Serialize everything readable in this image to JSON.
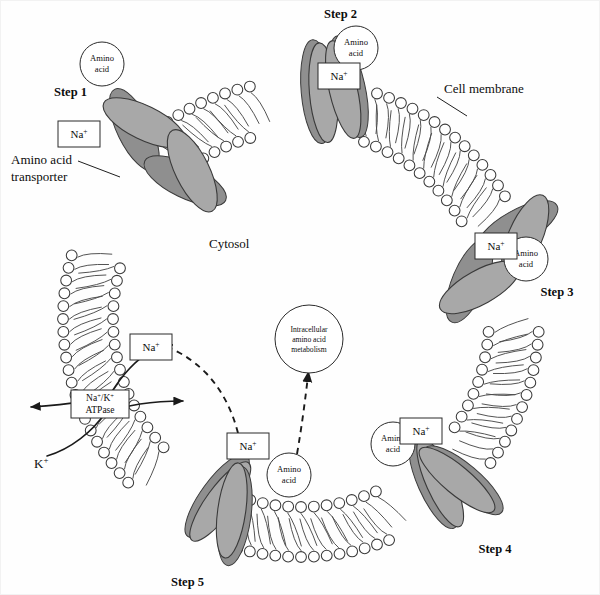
{
  "figure": {
    "background_color": "#fefefe",
    "protein_fill_color": "#a8a8a8",
    "line_color": "#1a1a1a"
  },
  "labels": {
    "cytosol": "Cytosol",
    "cell_membrane": "Cell membrane",
    "amino_acid_transporter_line1": "Amino acid",
    "amino_acid_transporter_line2": "transporter",
    "potassium": "K",
    "potassium_charge": "+",
    "atpase_line1_a": "Na",
    "atpase_line1_a_charge": "+",
    "atpase_line1_slash": "/K",
    "atpase_line1_b_charge": "+",
    "atpase_line2": "ATPase"
  },
  "steps": [
    {
      "id": "step-1",
      "label": "Step 1"
    },
    {
      "id": "step-2",
      "label": "Step 2"
    },
    {
      "id": "step-3",
      "label": "Step 3"
    },
    {
      "id": "step-4",
      "label": "Step 4"
    },
    {
      "id": "step-5",
      "label": "Step 5"
    }
  ],
  "bubbles": {
    "amino_acid_line1": "Amino",
    "amino_acid_line2": "acid",
    "metabolism_line1": "Intracellular",
    "metabolism_line2": "amino acid",
    "metabolism_line3": "metabolism"
  },
  "ion_boxes": {
    "sodium_symbol": "Na",
    "sodium_charge": "+"
  },
  "annotations": [
    {
      "name": "free-amino-acid-extracellular",
      "text": "Amino acid",
      "position": "top-left outside membrane"
    },
    {
      "name": "sodium-box-step1",
      "text": "Na+",
      "position": "step 1 transporter, outside"
    },
    {
      "name": "sodium-box-step2",
      "text": "Na+",
      "position": "step 2 transporter, outside"
    },
    {
      "name": "amino-acid-bubble-step2",
      "text": "Amino acid",
      "position": "step 2 transporter, outside"
    },
    {
      "name": "sodium-box-step3",
      "text": "Na+",
      "position": "step 3 transporter, inside"
    },
    {
      "name": "amino-acid-bubble-step3",
      "text": "Amino acid",
      "position": "step 3 transporter, inside"
    },
    {
      "name": "amino-acid-bubble-step4",
      "text": "Amino acid",
      "position": "step 4 transporter, inside"
    },
    {
      "name": "sodium-box-step4",
      "text": "Na+",
      "position": "step 4 transporter, inside"
    },
    {
      "name": "sodium-box-step5",
      "text": "Na+",
      "position": "step 5 transporter, inside cytosol"
    },
    {
      "name": "amino-acid-bubble-cytosol",
      "text": "Amino acid",
      "position": "cytosol, bottom center"
    },
    {
      "name": "sodium-box-pump",
      "text": "Na+",
      "position": "cytosol, above Na+/K+ ATPase"
    },
    {
      "name": "metabolism-bubble",
      "text": "Intracellular amino acid metabolism",
      "position": "cytosol center"
    }
  ]
}
